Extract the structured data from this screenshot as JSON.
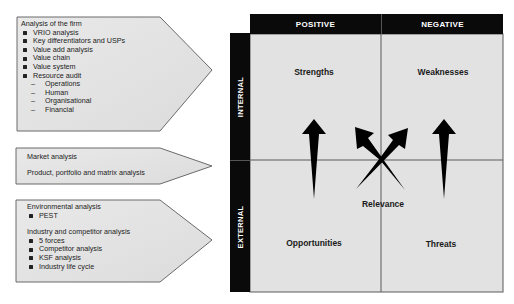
{
  "left_panels": [
    {
      "heading": "Analysis of the firm",
      "items": [
        "VRIO analysis",
        "Key differentiators and USPs",
        "Value add analysis",
        "Value chain",
        "Value system",
        "Resource audit"
      ],
      "subitems": [
        "Operations",
        "Human",
        "Organisational",
        "Financial"
      ],
      "dash": "–"
    },
    {
      "lines": [
        "Market analysis",
        "Product, portfolio and matrix analysis"
      ]
    },
    {
      "heading1": "Environmental analysis",
      "items1": [
        "PEST"
      ],
      "heading2": "Industry and competitor analysis",
      "items2": [
        "5 forces",
        "Competitor analysis",
        "KSF analysis",
        "Industry life cycle"
      ]
    }
  ],
  "matrix": {
    "columns": [
      "POSITIVE",
      "NEGATIVE"
    ],
    "rows": [
      "INTERNAL",
      "EXTERNAL"
    ],
    "cells": {
      "top_left": "Strengths",
      "top_right": "Weaknesses",
      "bottom_left": "Opportunities",
      "bottom_right": "Threats"
    },
    "center_label": "Relevance",
    "colors": {
      "header_bg": "#0a0a0a",
      "cell_bg": "#e2e2e2",
      "arrow": "#000000",
      "panel_bg": "#e4e4e4"
    }
  }
}
